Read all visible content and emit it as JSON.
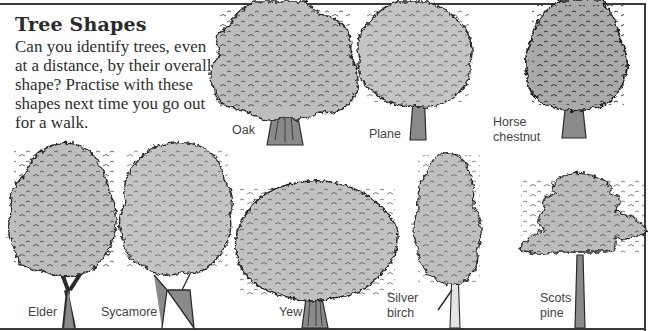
{
  "page": {
    "title": "Tree Shapes",
    "intro": "Can you identify trees, even at a distance, by their overall shape? Practise with these shapes next time you go out for a walk."
  },
  "colors": {
    "foliage": "#bdbdbd",
    "foliage_dark": "#2b2b2b",
    "trunk": "#8a8a8a",
    "frame": "#3a3a3a",
    "text": "#2e2e2e",
    "label": "#444444"
  },
  "trees": [
    {
      "id": "oak",
      "label": "Oak"
    },
    {
      "id": "plane",
      "label": "Plane"
    },
    {
      "id": "horse-chestnut",
      "label_line1": "Horse",
      "label_line2": "chestnut"
    },
    {
      "id": "elder",
      "label": "Elder"
    },
    {
      "id": "sycamore",
      "label": "Sycamore"
    },
    {
      "id": "yew",
      "label": "Yew"
    },
    {
      "id": "silver-birch",
      "label_line1": "Silver",
      "label_line2": "birch"
    },
    {
      "id": "scots-pine",
      "label_line1": "Scots",
      "label_line2": "pine"
    }
  ]
}
